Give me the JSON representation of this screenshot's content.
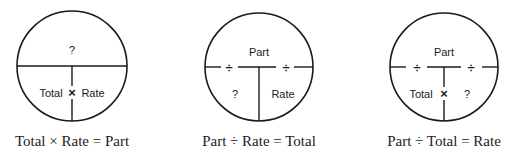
{
  "diagrams": [
    {
      "top_label": "?",
      "bottom_left_label": "Total",
      "bottom_right_label": "Rate",
      "center_operator": "×",
      "left_operator": "",
      "right_operator": "",
      "caption": "Total × Rate = Part"
    },
    {
      "top_label": "Part",
      "bottom_left_label": "?",
      "bottom_right_label": "Rate",
      "center_operator": "",
      "left_operator": "÷",
      "right_operator": "÷",
      "caption": "Part ÷ Rate = Total"
    },
    {
      "top_label": "Part",
      "bottom_left_label": "Total",
      "bottom_right_label": "?",
      "center_operator": "×",
      "left_operator": "÷",
      "right_operator": "÷",
      "caption": "Part ÷ Total = Rate"
    }
  ],
  "colors": {
    "stroke": "#1a1a1a",
    "background": "#ffffff"
  }
}
